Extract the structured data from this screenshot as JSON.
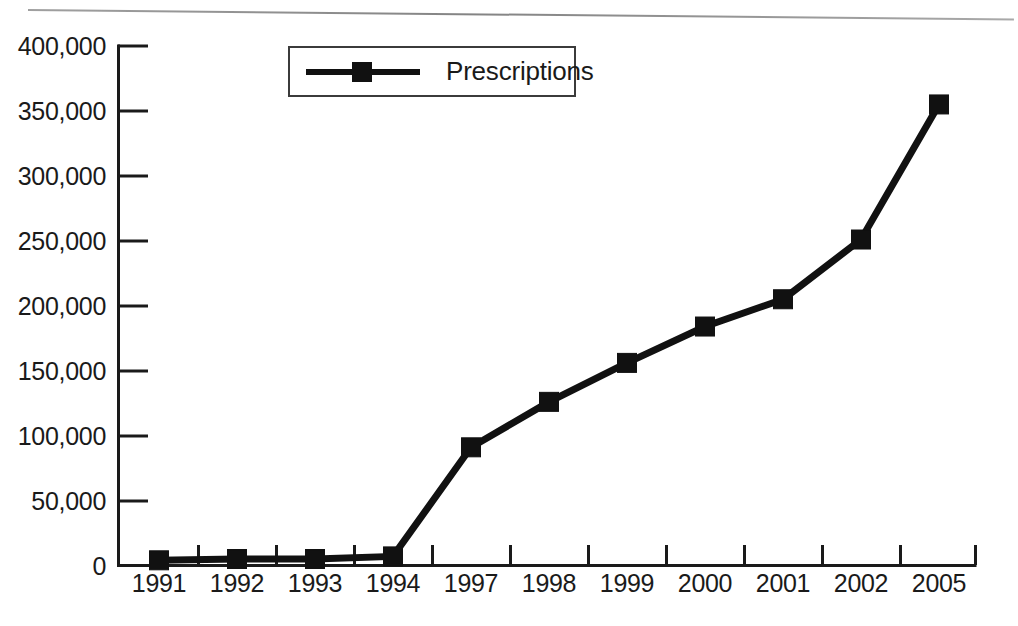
{
  "chart_data": {
    "type": "line",
    "title": "",
    "subtitle": "",
    "xlabel": "",
    "ylabel": "",
    "categories": [
      "1991",
      "1992",
      "1993",
      "1994",
      "1997",
      "1998",
      "1999",
      "2000",
      "2001",
      "2002",
      "2005"
    ],
    "series": [
      {
        "name": "Prescriptions",
        "values": [
          4000,
          5000,
          5000,
          7000,
          91000,
          126000,
          156000,
          184000,
          205000,
          251000,
          355000
        ],
        "color": "#111111",
        "marker": "square"
      }
    ],
    "ylim": [
      0,
      400000
    ],
    "yticks": [
      0,
      50000,
      100000,
      150000,
      200000,
      250000,
      300000,
      350000,
      400000
    ],
    "ytick_labels": [
      "0",
      "50,000",
      "100,000",
      "150,000",
      "200,000",
      "250,000",
      "300,000",
      "350,000",
      "400,000"
    ],
    "xtick_labels": [
      "1991",
      "1992",
      "1993",
      "1994",
      "1997",
      "1998",
      "1999",
      "2000",
      "2001",
      "2002",
      "2005"
    ],
    "grid": false,
    "legend": {
      "position": "top-left-inside",
      "entries": [
        "Prescriptions"
      ]
    }
  },
  "legend": {
    "label": "Prescriptions"
  },
  "axis": {
    "y_labels": [
      "400,000",
      "350,000",
      "300,000",
      "250,000",
      "200,000",
      "150,000",
      "100,000",
      "50,000",
      "0"
    ],
    "x_labels": [
      "1991",
      "1992",
      "1993",
      "1994",
      "1997",
      "1998",
      "1999",
      "2000",
      "2001",
      "2002",
      "2005"
    ]
  },
  "colors": {
    "line": "#111111",
    "axis": "#1a1a1a",
    "text": "#1a1a1a",
    "background": "#ffffff",
    "legend_border": "#3b3b3b"
  }
}
